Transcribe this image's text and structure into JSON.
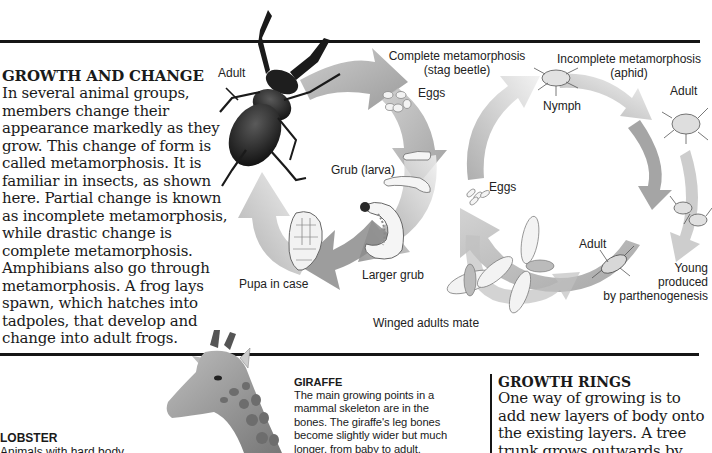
{
  "intro": {
    "heading": "GROWTH AND CHANGE",
    "body": "In several animal groups, members change their appearance markedly as they grow. This change of form is called metamorphosis. It is familiar in insects, as shown here. Partial change is known as incomplete metamorphosis, while drastic change is complete metamorphosis. Amphibians also go through metamorphosis. A frog lays spawn, which hatches into tadpoles, that develop and change into adult frogs."
  },
  "complete_cycle": {
    "title_line1": "Complete metamorphosis",
    "title_line2": "(stag beetle)",
    "labels": {
      "adult": "Adult",
      "eggs": "Eggs",
      "grub": "Grub (larva)",
      "larger_grub": "Larger grub",
      "pupa": "Pupa in case"
    },
    "colors": {
      "arrow_dark": "#8a8a8a",
      "arrow_light": "#e6e6e6",
      "beetle": "#1c1c1c"
    }
  },
  "incomplete_cycle": {
    "title_line1": "Incomplete metamorphosis",
    "title_line2": "(aphid)",
    "labels": {
      "nymph": "Nymph",
      "adult_top": "Adult",
      "eggs": "Eggs",
      "adult_bottom": "Adult",
      "young_line1": "Young",
      "young_line2": "produced",
      "young_line3": "by parthenogenesis",
      "winged": "Winged adults mate"
    }
  },
  "lobster": {
    "heading": "LOBSTER",
    "body_line1": "Animals with hard body"
  },
  "giraffe": {
    "heading": "GIRAFFE",
    "body": "The main growing points in a mammal skeleton are in the bones. The giraffe's leg bones become slightly wider but much longer, from baby to adult."
  },
  "growth_rings": {
    "heading": "GROWTH RINGS",
    "lines": [
      "One way of growing is to",
      "add new layers of body onto",
      "the existing layers. A tree",
      "trunk grows outwards by"
    ]
  }
}
